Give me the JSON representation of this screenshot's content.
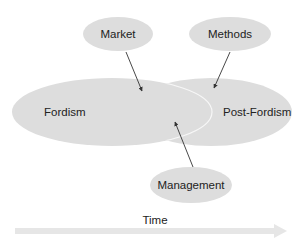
{
  "diagram": {
    "colors": {
      "background": "#ffffff",
      "ellipse_fill": "#dddddd",
      "overlap_outline": "#f7f7f7",
      "arrow": "#333333",
      "text": "#222222",
      "time_arrow": "#e6e6e6"
    },
    "nodes": [
      {
        "id": "fordism",
        "label": "Fordism",
        "cx": 112,
        "cy": 112,
        "rx": 100,
        "ry": 34
      },
      {
        "id": "post-fordism",
        "label": "Post-Fordism",
        "cx": 211,
        "cy": 112,
        "rx": 81,
        "ry": 34
      },
      {
        "id": "market",
        "label": "Market",
        "cx": 118,
        "cy": 34,
        "rx": 35,
        "ry": 17
      },
      {
        "id": "methods",
        "label": "Methods",
        "cx": 230,
        "cy": 34,
        "rx": 41,
        "ry": 17
      },
      {
        "id": "management",
        "label": "Management",
        "cx": 191,
        "cy": 185,
        "rx": 41,
        "ry": 18
      }
    ],
    "arrows": [
      {
        "from": "market",
        "to": "fordism/post-fordism overlap",
        "x1": 126,
        "y1": 52,
        "x2": 142,
        "y2": 91
      },
      {
        "from": "methods",
        "to": "post-fordism",
        "x1": 230,
        "y1": 52,
        "x2": 214,
        "y2": 88
      },
      {
        "from": "management",
        "to": "fordism/post-fordism overlap",
        "x1": 193,
        "y1": 167,
        "x2": 175,
        "y2": 122
      }
    ],
    "time_axis": {
      "label": "Time",
      "x1": 15,
      "x2": 287,
      "y": 231
    }
  }
}
